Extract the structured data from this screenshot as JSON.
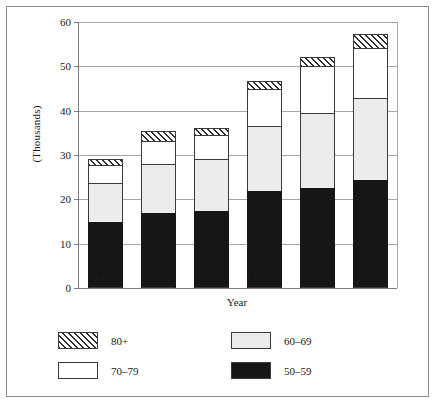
{
  "chart_data": {
    "type": "bar",
    "subtype": "stacked-bar",
    "title": "",
    "xlabel": "Year",
    "ylabel": "(Thousands)",
    "categories": [
      "1901",
      "1911",
      "1921",
      "1935",
      "1945",
      "1951"
    ],
    "ylim": [
      0,
      60
    ],
    "yticks": [
      0,
      10,
      20,
      30,
      40,
      50,
      60
    ],
    "ytick_labels": [
      "0",
      "10",
      "20",
      "30",
      "40",
      "50",
      "60"
    ],
    "grid": true,
    "grid_axis": "y",
    "legend_position": "below-plot",
    "stack_order_bottom_to_top": [
      "50-59",
      "60-69",
      "70-79",
      "80+"
    ],
    "series": [
      {
        "name": "50-59",
        "color": "#161616",
        "pattern": "solid-black",
        "values": [
          14.8,
          17.0,
          17.4,
          21.8,
          22.5,
          24.3
        ]
      },
      {
        "name": "60-69",
        "color": "#ececec",
        "pattern": "light-gray",
        "values": [
          8.9,
          10.9,
          11.6,
          14.8,
          16.9,
          18.5
        ]
      },
      {
        "name": "70-79",
        "color": "#ffffff",
        "pattern": "white",
        "values": [
          4.0,
          5.3,
          5.5,
          8.4,
          10.7,
          11.3
        ]
      },
      {
        "name": "80+",
        "color": "#ffffff",
        "pattern": "diagonal-hatch",
        "values": [
          1.3,
          2.2,
          1.7,
          1.8,
          1.9,
          3.1
        ]
      }
    ],
    "cumulative_tops": {
      "50-59": [
        14.8,
        17.0,
        17.4,
        21.8,
        22.5,
        24.3
      ],
      "60-69": [
        23.7,
        27.9,
        29.0,
        36.6,
        39.4,
        42.8
      ],
      "70-79": [
        27.7,
        33.2,
        34.5,
        45.0,
        50.1,
        54.1
      ],
      "80+": [
        29.0,
        35.4,
        36.2,
        46.8,
        52.0,
        57.2
      ]
    },
    "totals": [
      29.0,
      35.4,
      36.2,
      46.8,
      52.0,
      57.2
    ]
  },
  "legend": {
    "items": [
      {
        "label": "80+",
        "swatch": "diagonal-hatch",
        "row": 0,
        "col": 0
      },
      {
        "label": "60–69",
        "swatch": "light-gray",
        "row": 0,
        "col": 1
      },
      {
        "label": "70–79",
        "swatch": "white",
        "row": 1,
        "col": 0
      },
      {
        "label": "50–59",
        "swatch": "solid-black",
        "row": 1,
        "col": 1
      }
    ]
  }
}
